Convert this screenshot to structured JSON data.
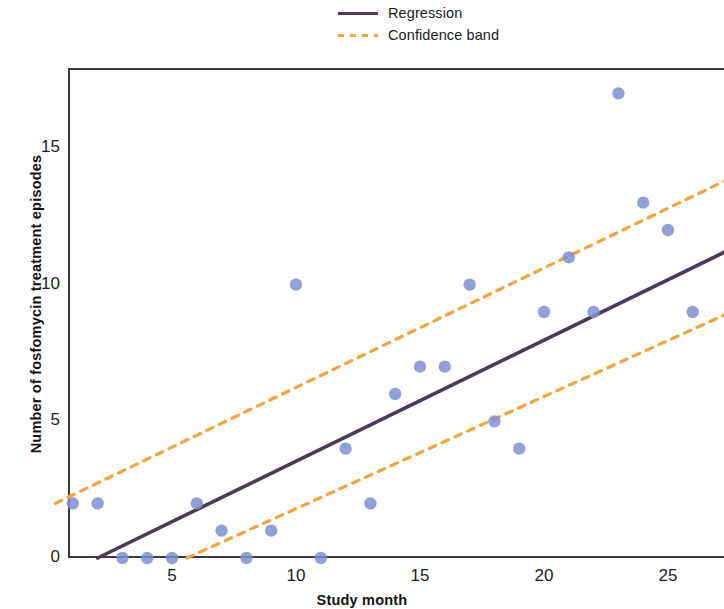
{
  "chart_data": {
    "type": "scatter",
    "title": "",
    "xlabel": "Study month",
    "ylabel": "Number of fosfomycin treatment episodes",
    "xlim": [
      0.3,
      27.3
    ],
    "ylim": [
      0,
      18
    ],
    "xticks": [
      5,
      10,
      15,
      20,
      25
    ],
    "yticks": [
      0,
      5,
      10,
      15
    ],
    "grid": false,
    "legend_position": "top-center",
    "legend": [
      {
        "label": "Regression",
        "style": "solid",
        "color": "#4b3a56"
      },
      {
        "label": "Confidence band",
        "style": "dashed",
        "color": "#f5a33c"
      }
    ],
    "series": [
      {
        "name": "Observed episodes",
        "type": "scatter",
        "color": "#7e8fd4",
        "marker": "circle",
        "x": [
          1,
          2,
          3,
          4,
          5,
          6,
          7,
          8,
          9,
          10,
          11,
          12,
          13,
          14,
          15,
          16,
          17,
          18,
          19,
          20,
          21,
          22,
          23,
          24,
          25,
          26
        ],
        "y": [
          2,
          2,
          0,
          0,
          0,
          2,
          1,
          0,
          1,
          10,
          0,
          4,
          2,
          6,
          7,
          7,
          10,
          5,
          4,
          9,
          11,
          9,
          17,
          13,
          12,
          9
        ]
      },
      {
        "name": "Regression",
        "type": "line",
        "color": "#4b3a56",
        "style": "solid",
        "x": [
          2.0,
          27.3
        ],
        "y": [
          0.0,
          11.2
        ]
      },
      {
        "name": "Confidence band upper",
        "type": "line",
        "color": "#f5a33c",
        "style": "dashed",
        "x": [
          0.3,
          27.3
        ],
        "y": [
          2.0,
          13.8
        ]
      },
      {
        "name": "Confidence band lower",
        "type": "line",
        "color": "#f5a33c",
        "style": "dashed",
        "x": [
          5.6,
          27.3
        ],
        "y": [
          0.0,
          8.9
        ]
      }
    ]
  },
  "axes": {
    "x_tick_labels": [
      "5",
      "10",
      "15",
      "20",
      "25"
    ],
    "y_tick_labels": [
      "0",
      "5",
      "10",
      "15"
    ],
    "x_title": "Study month",
    "y_title": "Number of fosfomycin treatment episodes"
  },
  "legend": {
    "items": [
      {
        "label": "Regression"
      },
      {
        "label": "Confidence band"
      }
    ]
  },
  "colors": {
    "point": "#7e8fd4",
    "regression": "#4b3a56",
    "confidence": "#f5a33c",
    "axis": "#3a3a3a",
    "text": "#1c1c1c"
  }
}
